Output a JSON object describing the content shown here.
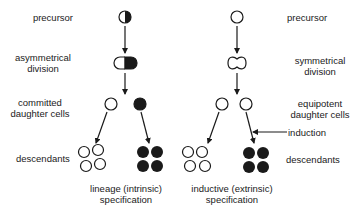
{
  "diagram": {
    "type": "cell-fate specification comparison",
    "left_panel": {
      "labels": {
        "precursor": "precursor",
        "division_1": "asymmetrical",
        "division_2": "division",
        "daughters_1": "committed",
        "daughters_2": "daughter cells",
        "descendants": "descendants",
        "caption_1": "lineage (intrinsic)",
        "caption_2": "specification"
      },
      "precursor_fill": "half-black",
      "daughter_fills": [
        "white",
        "black"
      ],
      "descendant_fills": [
        "white",
        "black"
      ]
    },
    "right_panel": {
      "labels": {
        "precursor": "precursor",
        "division_1": "symmetrical",
        "division_2": "division",
        "daughters_1": "equipotent",
        "daughters_2": "daughter cells",
        "induction": "induction",
        "descendants": "descendants",
        "caption_1": "inductive (extrinsic)",
        "caption_2": "specification"
      },
      "precursor_fill": "white",
      "daughter_fills": [
        "white",
        "white"
      ],
      "descendant_fills": [
        "white",
        "black"
      ]
    },
    "colors": {
      "ink": "#1a1a1a",
      "background": "#ffffff"
    }
  }
}
